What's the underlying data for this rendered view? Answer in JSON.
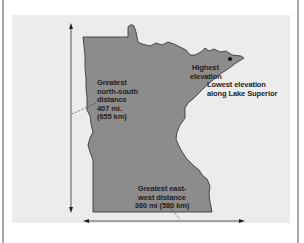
{
  "figure": {
    "colors": {
      "background": "#ffffff",
      "panel": "#ececec",
      "state_fill": "#8c8c8c",
      "state_outline": "#3a3a3a",
      "text": "#1e1e1e",
      "arrow": "#333333",
      "frame": "#a9a9a9"
    },
    "labels": {
      "north_south": [
        "Greatest",
        "north-south",
        "distance",
        "407 mi.",
        "(655 km)"
      ],
      "highest": [
        "Highest",
        "elevation"
      ],
      "lowest": [
        "Lowest elevation",
        "along Lake Superior"
      ],
      "east_west": [
        "Greatest east-",
        "west distance",
        "360 mi (580 km)"
      ]
    },
    "markers": {
      "highest_point": "dot-marker"
    },
    "arrows": {
      "vertical": "north-south-arrow",
      "horizontal": "east-west-arrow"
    }
  }
}
